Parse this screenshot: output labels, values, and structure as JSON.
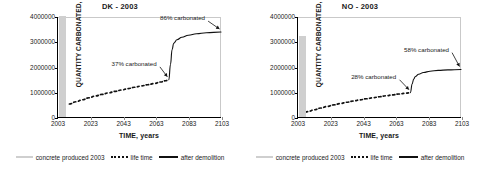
{
  "figure": {
    "legend": {
      "items": [
        {
          "key": "produced",
          "label": "concrete produced 2003",
          "style": "gray-band",
          "color": "#cfcfcf"
        },
        {
          "key": "lifetime",
          "label": "life time",
          "style": "dotted",
          "color": "#111111"
        },
        {
          "key": "demolition",
          "label": "after demolition",
          "style": "solid",
          "color": "#111111"
        }
      ]
    }
  },
  "chart_data": [
    {
      "type": "line",
      "title": "DK - 2003",
      "xlabel": "TIME, years",
      "ylabel": "QUANTITY CARBONATED, m",
      "ylabel_sup": "3",
      "xlim": [
        2003,
        2103
      ],
      "ylim": [
        0,
        4000000
      ],
      "xticks": [
        "2003",
        "2023",
        "2043",
        "2063",
        "2083",
        "2103"
      ],
      "xtick_values": [
        2003,
        2023,
        2043,
        2063,
        2083,
        2103
      ],
      "yticks": [
        "0",
        "1000000",
        "2000000",
        "3000000",
        "4000000"
      ],
      "ytick_values": [
        0,
        1000000,
        2000000,
        3000000,
        4000000
      ],
      "grid": false,
      "legend_position": "bottom",
      "bar": {
        "name": "concrete produced 2003",
        "x": 2003,
        "value": 4000000,
        "color": "#cfcfcf",
        "width_years": 4
      },
      "series": [
        {
          "name": "life time",
          "style": "dotted",
          "x": [
            2010,
            2014,
            2018,
            2022,
            2026,
            2030,
            2034,
            2038,
            2042,
            2046,
            2050,
            2054,
            2058,
            2062,
            2066,
            2069,
            2071
          ],
          "values": [
            520000,
            610000,
            690000,
            770000,
            840000,
            905000,
            965000,
            1025000,
            1080000,
            1135000,
            1190000,
            1240000,
            1290000,
            1340000,
            1400000,
            1450000,
            1490000
          ]
        },
        {
          "name": "after demolition",
          "style": "solid",
          "x": [
            2071,
            2072,
            2073,
            2074,
            2076,
            2079,
            2083,
            2088,
            2094,
            2103
          ],
          "values": [
            1490000,
            2100000,
            2700000,
            2950000,
            3090000,
            3190000,
            3270000,
            3330000,
            3370000,
            3400000
          ]
        }
      ],
      "annotations": [
        {
          "text": "37% carbonated",
          "target_x": 2071,
          "target_y": 1490000
        },
        {
          "text": "86% carbonated",
          "target_x": 2103,
          "target_y": 3400000
        }
      ]
    },
    {
      "type": "line",
      "title": "NO - 2003",
      "xlabel": "TIME, years",
      "ylabel": "QUANTITY CARBONATED, m",
      "ylabel_sup": "3",
      "xlim": [
        2003,
        2103
      ],
      "ylim": [
        0,
        4000000
      ],
      "xticks": [
        "2003",
        "2023",
        "2043",
        "2063",
        "2083",
        "2103"
      ],
      "xtick_values": [
        2003,
        2023,
        2043,
        2063,
        2083,
        2103
      ],
      "yticks": [
        "0",
        "1000000",
        "2000000",
        "3000000",
        "4000000"
      ],
      "ytick_values": [
        0,
        1000000,
        2000000,
        3000000,
        4000000
      ],
      "grid": false,
      "legend_position": "bottom",
      "bar": {
        "name": "concrete produced 2003",
        "x": 2003,
        "value": 3200000,
        "color": "#cfcfcf",
        "width_years": 4
      },
      "series": [
        {
          "name": "life time",
          "style": "dotted",
          "x": [
            2005,
            2009,
            2013,
            2017,
            2021,
            2025,
            2029,
            2033,
            2037,
            2041,
            2045,
            2049,
            2053,
            2057,
            2061,
            2065,
            2069,
            2072
          ],
          "values": [
            130000,
            215000,
            290000,
            360000,
            425000,
            485000,
            540000,
            590000,
            640000,
            685000,
            730000,
            770000,
            810000,
            850000,
            885000,
            920000,
            950000,
            975000
          ]
        },
        {
          "name": "after demolition",
          "style": "solid",
          "x": [
            2072,
            2073,
            2074,
            2075,
            2077,
            2080,
            2084,
            2089,
            2095,
            2103
          ],
          "values": [
            975000,
            1320000,
            1520000,
            1620000,
            1710000,
            1780000,
            1830000,
            1865000,
            1885000,
            1900000
          ]
        }
      ],
      "annotations": [
        {
          "text": "28% carbonated",
          "target_x": 2072,
          "target_y": 975000
        },
        {
          "text": "58% carbonated",
          "target_x": 2103,
          "target_y": 1900000
        }
      ]
    }
  ]
}
